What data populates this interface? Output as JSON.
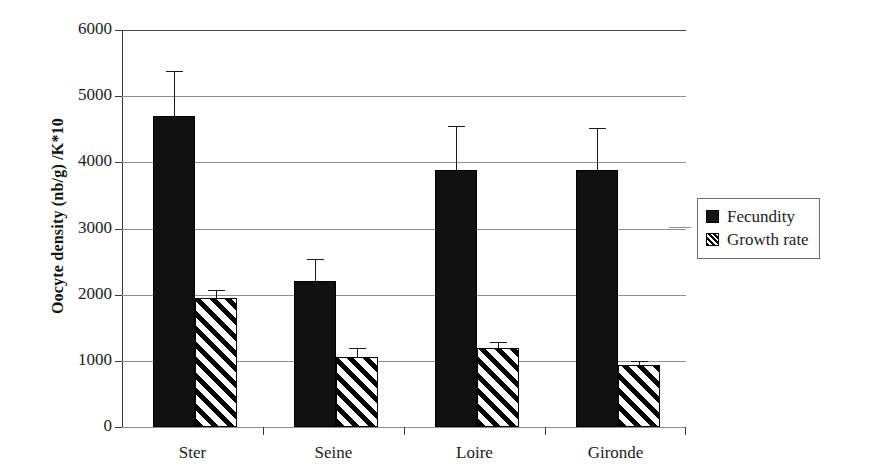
{
  "chart_data": {
    "type": "bar",
    "title": "",
    "xlabel": "",
    "ylabel": "Oocyte density (nb/g) /K*10",
    "ylim": [
      0,
      6000
    ],
    "ytick_values": [
      0,
      1000,
      2000,
      3000,
      4000,
      5000,
      6000
    ],
    "ytick_labels": [
      "0",
      "1000",
      "2000",
      "3000",
      "4000",
      "5000",
      "6000"
    ],
    "grid": true,
    "legend_position": "right",
    "categories": [
      "Ster",
      "Seine",
      "Loire",
      "Gironde"
    ],
    "series": [
      {
        "name": "Fecundity",
        "fill": "solid-black",
        "values": [
          4700,
          2200,
          3890,
          3880
        ],
        "errors": [
          690,
          350,
          680,
          660
        ]
      },
      {
        "name": "Growth rate",
        "fill": "diagonal-hatch",
        "values": [
          1950,
          1060,
          1190,
          940
        ],
        "errors": [
          130,
          150,
          110,
          70
        ]
      }
    ]
  },
  "axis": {
    "y_title": "Oocyte density (nb/g) /K*10"
  },
  "legend": {
    "items": [
      {
        "label": "Fecundity",
        "swatch": "solid-black-square-icon"
      },
      {
        "label": "Growth rate",
        "swatch": "hatched-square-icon"
      }
    ]
  },
  "colors": {
    "series_fecundity": "#111111",
    "series_growth_rate": "#ffffff",
    "hatch": "#000000",
    "gridline": "#8d8d8d",
    "axis": "#3a3a3a",
    "text": "#1c1c1c",
    "background": "#ffffff"
  }
}
